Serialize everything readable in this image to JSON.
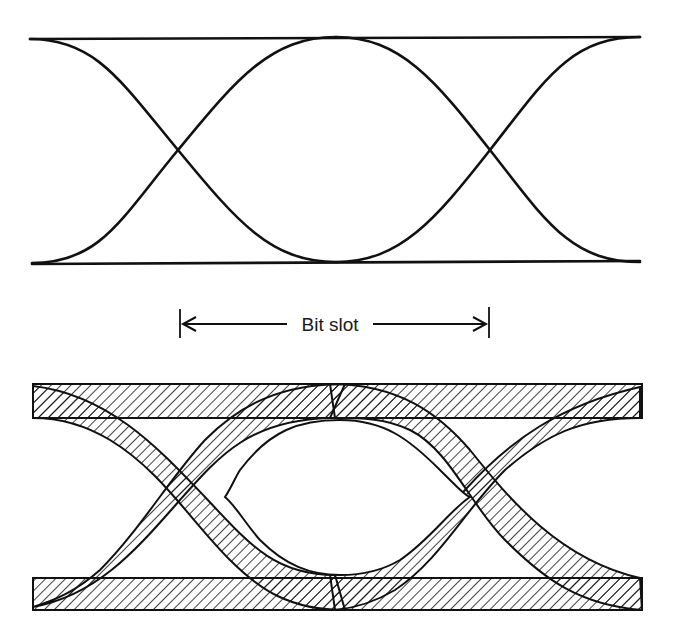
{
  "figure": {
    "background": "#ffffff",
    "ink_color": "#111111",
    "top_diagram": {
      "name": "ideal-eye-diagram",
      "upper_level_y": 37,
      "lower_level_y": 262,
      "x_start": 30,
      "x_end": 640,
      "crossings_x": [
        178,
        490
      ]
    },
    "annotation": {
      "label": "Bit slot",
      "left_x": 180,
      "right_x": 490,
      "y": 323
    },
    "bottom_diagram": {
      "name": "degraded-eye-diagram",
      "upper_band": [
        383,
        418
      ],
      "lower_band": [
        578,
        610
      ],
      "x_start": 32,
      "x_end": 642,
      "crossings_x": [
        195,
        480
      ],
      "hatch": "diagonal"
    }
  }
}
